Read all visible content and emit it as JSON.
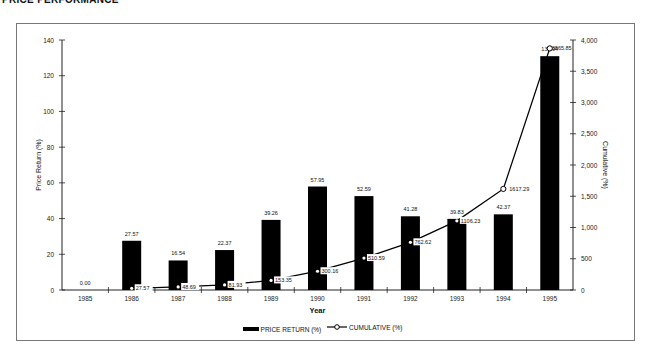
{
  "header": {
    "title": "PRICE PERFORMANCE"
  },
  "chart_data": {
    "type": "bar+line",
    "title": "PRICE PERFORMANCE",
    "xlabel": "Year",
    "ylabel": "Price Return (%)",
    "y2label": "Cumulative (%)",
    "ylim": [
      0,
      140
    ],
    "y2lim": [
      0,
      4000
    ],
    "yticks": [
      0,
      20,
      40,
      60,
      80,
      100,
      120,
      140
    ],
    "y2ticks": [
      "0",
      "500",
      "1,000",
      "1,500",
      "2,000",
      "2,500",
      "3,000",
      "3,500",
      "4,000"
    ],
    "categories": [
      "1985",
      "1986",
      "1987",
      "1988",
      "1989",
      "1990",
      "1991",
      "1992",
      "1993",
      "1994",
      "1995"
    ],
    "series": [
      {
        "name": "PRICE RETURN (%)",
        "type": "bar",
        "axis": "left",
        "values": [
          0.0,
          27.57,
          16.54,
          22.37,
          39.26,
          57.95,
          52.59,
          41.28,
          39.83,
          42.37,
          130.94
        ],
        "labels": [
          "0.00",
          "27.57",
          "16.54",
          "22.37",
          "39.26",
          "57.95",
          "52.59",
          "41.28",
          "39.83",
          "42.37",
          "130.94"
        ]
      },
      {
        "name": "CUMULATIVE (%)",
        "type": "line",
        "axis": "right",
        "marker": "circle",
        "values": [
          null,
          27.57,
          48.67,
          81.93,
          153.35,
          300.16,
          510.59,
          762.62,
          1106.23,
          1617.29,
          3865.85
        ],
        "labels": [
          "",
          "27.57",
          "48.69",
          "81.93",
          "153.35",
          "300.16",
          "510.59",
          "762.62",
          "1106.23",
          "1617.29",
          "3865.85"
        ]
      }
    ],
    "grid": false,
    "legend_position": "bottom"
  },
  "legend": {
    "bar_label": "PRICE RETURN (%)",
    "line_label": "CUMULATIVE (%)"
  }
}
